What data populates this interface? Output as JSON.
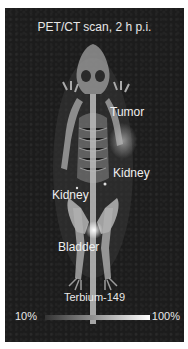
{
  "title": "PET/CT scan, 2 h p.i.",
  "labels": {
    "tumor": "Tumor",
    "kidney_right": "Kidney",
    "kidney_left": "Kidney",
    "bladder": "Bladder"
  },
  "colorscale": {
    "title": "Terbium-149",
    "min_label": "10%",
    "max_label": "100%",
    "start_color": "#333333",
    "end_color": "#ffffff"
  },
  "colors": {
    "background": "#1c1c1c",
    "text": "#eeeeee"
  }
}
